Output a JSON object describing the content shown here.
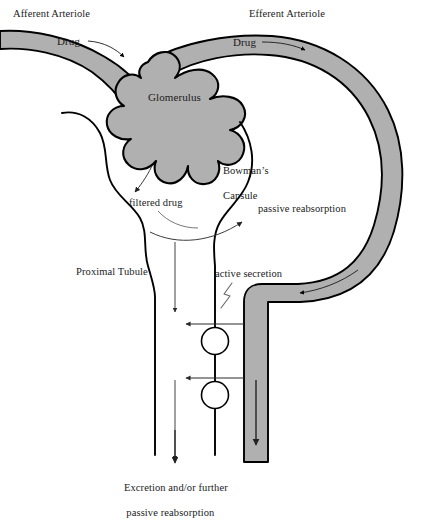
{
  "diagram": {
    "type": "biological-schematic",
    "canvas": {
      "width": 422,
      "height": 509
    },
    "colors": {
      "vessel_fill": "#b0b0b0",
      "vessel_stroke": "#000000",
      "tubule_stroke": "#000000",
      "text": "#1a1a1a",
      "background": "#ffffff",
      "thin_arrow": "#333333"
    }
  },
  "labels": {
    "afferent_arteriole": "Afferent Arteriole",
    "efferent_arteriole": "Efferent Arteriole",
    "drug_afferent": "Drug",
    "drug_efferent": "Drug",
    "glomerulus": "Glomerulus",
    "bowmans_capsule_line1": "Bowman’s",
    "bowmans_capsule_line2": "Capsule",
    "filtered_drug": "filtered drug",
    "passive_reabsorption": "passive reabsorption",
    "proximal_tubule": "Proximal Tubule",
    "active_secretion": "active secretion",
    "excretion_line1": "Excretion and/or further",
    "excretion_line2": "passive reabsorption"
  },
  "structures": [
    {
      "name": "afferent-arteriole",
      "role": "blood vessel carrying drug toward glomerulus",
      "flow": "rightward"
    },
    {
      "name": "glomerulus",
      "role": "capillary tuft where filtration occurs",
      "lobes": 6
    },
    {
      "name": "bowmans-capsule",
      "role": "capsule surrounding glomerulus collecting filtrate"
    },
    {
      "name": "efferent-arteriole",
      "role": "blood vessel leaving glomerulus, wraps around tubule",
      "flow": "rightward-then-down"
    },
    {
      "name": "proximal-tubule",
      "role": "tubule carrying filtrate downward",
      "flow": "downward"
    },
    {
      "name": "secretion-site-upper",
      "role": "active transport carrier",
      "shape": "circle"
    },
    {
      "name": "secretion-site-lower",
      "role": "active transport carrier",
      "shape": "circle"
    }
  ],
  "processes": [
    {
      "name": "filtration",
      "label": "filtered drug",
      "direction": "glomerulus to tubule lumen"
    },
    {
      "name": "passive-reabsorption",
      "label": "passive reabsorption",
      "direction": "tubule lumen to capillary"
    },
    {
      "name": "active-secretion",
      "label": "active secretion",
      "direction": "capillary to tubule lumen"
    },
    {
      "name": "excretion",
      "label": "Excretion and/or further passive reabsorption",
      "direction": "downward out of nephron"
    }
  ]
}
